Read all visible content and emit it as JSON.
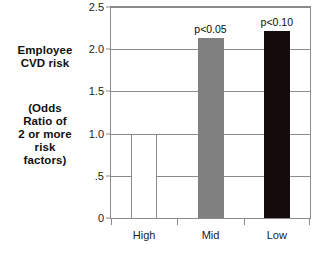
{
  "labels": {
    "primary_caption": [
      "Employee",
      "CVD risk"
    ],
    "secondary_caption": [
      "(Odds",
      "Ratio of",
      "2 or more",
      "risk",
      "factors)"
    ]
  },
  "chart_data": {
    "type": "bar",
    "title": "",
    "xlabel": "",
    "ylabel": "Employee CVD risk (Odds Ratio of 2 or more risk factors)",
    "categories": [
      "High",
      "Mid",
      "Low"
    ],
    "values": [
      1.0,
      2.13,
      2.22
    ],
    "annotations": [
      "",
      "p<0.05",
      "p<0.10"
    ],
    "bar_styles": [
      "outline",
      "gray",
      "black"
    ],
    "bar_colors": [
      "#ffffff",
      "#808080",
      "#140b0b"
    ],
    "ylim": [
      0,
      2.5
    ],
    "yticks": [
      0,
      0.5,
      1.0,
      1.5,
      2.0,
      2.5
    ],
    "ytick_labels": [
      "0",
      ".5",
      "1.0",
      "1.5",
      "2.0",
      "2.5"
    ],
    "grid": true,
    "legend": "none",
    "axis_color": "#8a8a8a"
  }
}
